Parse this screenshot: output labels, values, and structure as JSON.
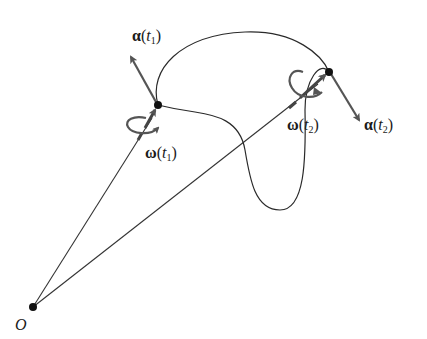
{
  "diagram": {
    "type": "rigid body rotation along a trajectory",
    "origin": {
      "label": "O"
    },
    "points": [
      {
        "id": "t1",
        "angular_velocity_label": {
          "symbol": "ω",
          "open": "(",
          "arg": "t",
          "sub": "1",
          "close": ")"
        },
        "angular_acceleration_label": {
          "symbol": "α",
          "open": "(",
          "arg": "t",
          "sub": "1",
          "close": ")"
        }
      },
      {
        "id": "t2",
        "angular_velocity_label": {
          "symbol": "ω",
          "open": "(",
          "arg": "t",
          "sub": "2",
          "close": ")"
        },
        "angular_acceleration_label": {
          "symbol": "α",
          "open": "(",
          "arg": "t",
          "sub": "2",
          "close": ")"
        }
      }
    ],
    "colors": {
      "curve": "#2a2a2a",
      "vector_arrow": "#555555",
      "point": "#111111",
      "text": "#1a1a1a"
    }
  }
}
